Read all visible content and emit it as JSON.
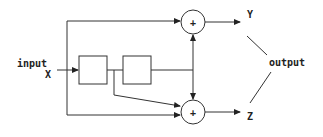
{
  "diagram": {
    "input_label": "input",
    "input_var": "X",
    "output_label": "output",
    "output_top": "Y",
    "output_bottom": "Z",
    "sum_symbol": "+",
    "blocks": [
      {
        "id": "block-1",
        "label": ""
      },
      {
        "id": "block-2",
        "label": ""
      }
    ],
    "adders": [
      {
        "id": "adder-top",
        "symbol": "+"
      },
      {
        "id": "adder-bottom",
        "symbol": "+"
      }
    ]
  }
}
